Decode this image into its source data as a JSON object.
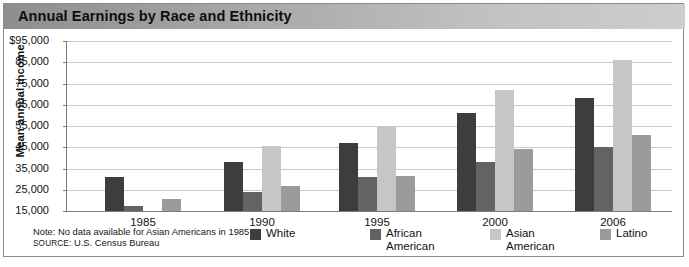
{
  "title": "Annual Earnings by Race and Ethnicity",
  "note": "Note: No data available for Asian Americans in 1985",
  "source_label": "SOURCE:",
  "source_text": " U.S. Census Bureau",
  "colors": {
    "white": "#3d3d3d",
    "african_american": "#636363",
    "asian_american": "#c6c6c6",
    "latino": "#9b9b9b",
    "gridline": "#c9c9c9",
    "axis": "#7b7b7b",
    "title_bar_left": "#8e8e8e",
    "title_bar_right": "#cdcdcd"
  },
  "chart_data": {
    "type": "bar",
    "title": "Annual Earnings by Race and Ethnicity",
    "xlabel": "",
    "ylabel": "Mean annual income",
    "ylim": [
      15000,
      95000
    ],
    "ytick_labels": [
      "$95,000",
      "85,000",
      "75,000",
      "65,000",
      "55,000",
      "45,000",
      "35,000",
      "25,000",
      "15,000"
    ],
    "ytick_values": [
      95000,
      85000,
      75000,
      65000,
      55000,
      45000,
      35000,
      25000,
      15000
    ],
    "grid": true,
    "legend_position": "bottom",
    "categories": [
      "1985",
      "1990",
      "1995",
      "2000",
      "2006"
    ],
    "series": [
      {
        "name": "White",
        "values": [
          31000,
          38000,
          47000,
          61000,
          68000
        ]
      },
      {
        "name": "African\nAmerican",
        "values": [
          17500,
          24000,
          31000,
          38000,
          45000
        ]
      },
      {
        "name": "Asian\nAmerican",
        "values": [
          null,
          45500,
          54500,
          72000,
          86000
        ]
      },
      {
        "name": "Latino",
        "values": [
          20500,
          27000,
          31500,
          44000,
          51000
        ]
      }
    ],
    "annotations": [
      "Note: No data available for Asian Americans in 1985",
      "SOURCE: U.S. Census Bureau"
    ]
  }
}
